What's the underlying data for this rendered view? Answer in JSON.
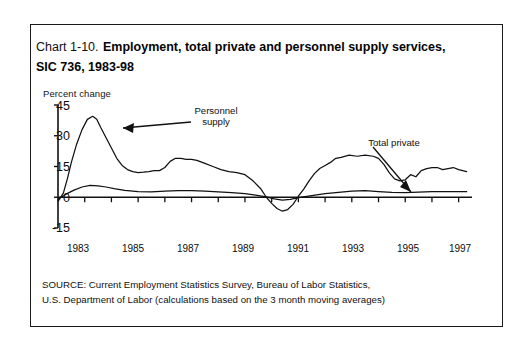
{
  "figure": {
    "chart_number": "Chart 1-10.",
    "title": "Employment, total private and personnel supply services, SIC 736, 1983-98",
    "source_line_1": "SOURCE: Current Employment Statistics Survey, Bureau of Labor Statistics,",
    "source_line_2": "U.S. Department of Labor (calculations based on the 3 month moving averages)"
  },
  "annotations": {
    "personnel_label_line1": "Personnel",
    "personnel_label_line2": "supply",
    "total_private_label": "Total private"
  },
  "chart_data": {
    "type": "line",
    "title": "Employment, total private and personnel supply services, SIC 736, 1983-98",
    "xlabel": "",
    "ylabel": "Percent change",
    "ylim": [
      -15,
      45
    ],
    "xlim": [
      1983,
      1998.5
    ],
    "yticks": [
      45,
      30,
      15,
      0,
      -15
    ],
    "ytick_labels": [
      "45",
      "30",
      "15",
      "0",
      "-15"
    ],
    "xticks": [
      1983,
      1984,
      1985,
      1986,
      1987,
      1988,
      1989,
      1990,
      1991,
      1992,
      1993,
      1994,
      1995,
      1996,
      1997,
      1998
    ],
    "xtick_labels_shown": [
      "1983",
      "1985",
      "1987",
      "1989",
      "1991",
      "1993",
      "1995",
      "1997"
    ],
    "grid": false,
    "legend": "annotated-arrows",
    "line_color": "#111111",
    "series": [
      {
        "name": "Personnel supply",
        "x": [
          1983.0,
          1983.2,
          1983.35,
          1983.5,
          1983.7,
          1983.9,
          1984.1,
          1984.3,
          1984.45,
          1984.6,
          1984.8,
          1985.0,
          1985.2,
          1985.4,
          1985.6,
          1985.8,
          1986.0,
          1986.2,
          1986.4,
          1986.6,
          1986.8,
          1987.0,
          1987.2,
          1987.4,
          1987.6,
          1987.8,
          1988.0,
          1988.2,
          1988.5,
          1988.8,
          1989.1,
          1989.4,
          1989.7,
          1990.0,
          1990.3,
          1990.6,
          1990.8,
          1991.0,
          1991.2,
          1991.4,
          1991.6,
          1991.8,
          1992.0,
          1992.2,
          1992.4,
          1992.6,
          1992.8,
          1993.0,
          1993.2,
          1993.4,
          1993.6,
          1993.9,
          1994.2,
          1994.5,
          1994.8,
          1995.0,
          1995.2,
          1995.4,
          1995.6,
          1995.8,
          1996.0,
          1996.2,
          1996.4,
          1996.6,
          1996.8,
          1997.0,
          1997.2,
          1997.4,
          1997.6,
          1997.8,
          1998.0,
          1998.3
        ],
        "values": [
          -2.0,
          2.0,
          9.0,
          17.0,
          26.0,
          33.0,
          38.0,
          39.5,
          38.0,
          34.0,
          29.0,
          24.0,
          19.0,
          15.5,
          13.5,
          12.5,
          12.0,
          12.2,
          12.5,
          13.0,
          13.0,
          14.5,
          17.5,
          19.0,
          19.0,
          18.5,
          18.5,
          18.0,
          16.5,
          15.0,
          13.5,
          12.5,
          12.0,
          11.0,
          8.0,
          4.0,
          0.0,
          -3.0,
          -5.5,
          -6.8,
          -6.0,
          -3.5,
          0.5,
          4.0,
          8.0,
          11.5,
          14.0,
          15.5,
          17.0,
          19.0,
          19.5,
          20.5,
          20.0,
          20.5,
          20.0,
          19.0,
          16.0,
          12.0,
          9.0,
          8.0,
          8.5,
          11.0,
          10.0,
          13.0,
          14.0,
          14.5,
          14.5,
          13.5,
          14.0,
          14.5,
          13.5,
          12.5
        ]
      },
      {
        "name": "Total private",
        "x": [
          1983.0,
          1983.3,
          1983.6,
          1983.9,
          1984.2,
          1984.5,
          1984.8,
          1985.1,
          1985.5,
          1986.0,
          1986.5,
          1987.0,
          1987.5,
          1988.0,
          1988.5,
          1989.0,
          1989.5,
          1990.0,
          1990.4,
          1990.8,
          1991.1,
          1991.4,
          1991.7,
          1992.0,
          1992.5,
          1993.0,
          1993.5,
          1994.0,
          1994.5,
          1995.0,
          1995.5,
          1996.0,
          1996.5,
          1997.0,
          1997.5,
          1998.0,
          1998.3
        ],
        "values": [
          -1.0,
          1.5,
          3.5,
          5.0,
          5.8,
          5.5,
          5.0,
          4.2,
          3.4,
          2.8,
          2.6,
          3.0,
          3.2,
          3.2,
          3.0,
          2.6,
          2.2,
          1.8,
          1.0,
          0.2,
          -0.8,
          -1.4,
          -1.0,
          -0.2,
          0.8,
          1.8,
          2.4,
          3.0,
          3.2,
          2.8,
          2.4,
          2.3,
          2.5,
          2.7,
          2.8,
          2.8,
          2.7
        ]
      }
    ]
  }
}
